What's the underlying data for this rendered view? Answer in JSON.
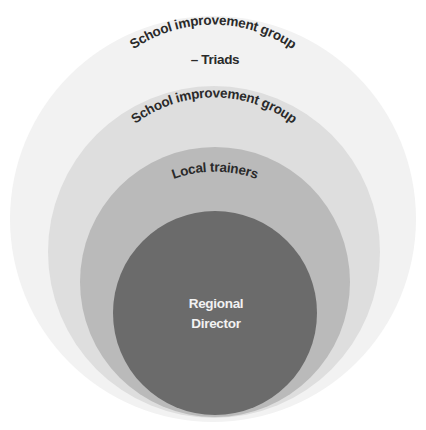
{
  "diagram": {
    "type": "nested-circles",
    "levels": [
      {
        "label_line1": "School improvement group",
        "label_line2": "– Triads",
        "color": "#f1f1f1"
      },
      {
        "label": "School improvement group",
        "color": "#dedede"
      },
      {
        "label": "Local trainers",
        "color": "#b9b9b9"
      },
      {
        "label_line1": "Regional",
        "label_line2": "Director",
        "color": "#6b6b6b"
      }
    ]
  }
}
